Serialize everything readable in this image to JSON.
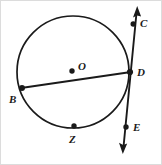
{
  "figure": {
    "kind": "circle-geometry-diagram",
    "width": 162,
    "height": 165,
    "stroke_color": "#1a1a1a",
    "background_color": "#ffffff",
    "border_color": "#d8d8d8"
  },
  "circle": {
    "name": "circle-O",
    "center_x": 73,
    "center_y": 72,
    "radius": 56,
    "center_label": "O",
    "center_dot_x": 72,
    "center_dot_y": 71
  },
  "chord": {
    "name": "chord-BD",
    "from_label": "B",
    "to_label": "D",
    "x1": 22,
    "y1": 88,
    "x2": 130,
    "y2": 72
  },
  "line": {
    "name": "line-CE",
    "from_label": "C",
    "to_label": "E",
    "top_x": 137,
    "top_y": 8,
    "bottom_x": 123,
    "bottom_y": 152,
    "double_arrow": true
  },
  "points": [
    {
      "id": "O",
      "label": "O",
      "x": 72,
      "y": 71,
      "dot": true
    },
    {
      "id": "C",
      "label": "C",
      "x": 133,
      "y": 24,
      "dot": true
    },
    {
      "id": "D",
      "label": "D",
      "x": 130,
      "y": 72,
      "dot": true
    },
    {
      "id": "E",
      "label": "E",
      "x": 126,
      "y": 127,
      "dot": true
    },
    {
      "id": "B",
      "label": "B",
      "x": 22,
      "y": 88,
      "dot": true
    },
    {
      "id": "Z",
      "label": "Z",
      "x": 74,
      "y": 126,
      "dot": true
    }
  ],
  "labels": {
    "O": "O",
    "C": "C",
    "D": "D",
    "E": "E",
    "B": "B",
    "Z": "Z"
  }
}
